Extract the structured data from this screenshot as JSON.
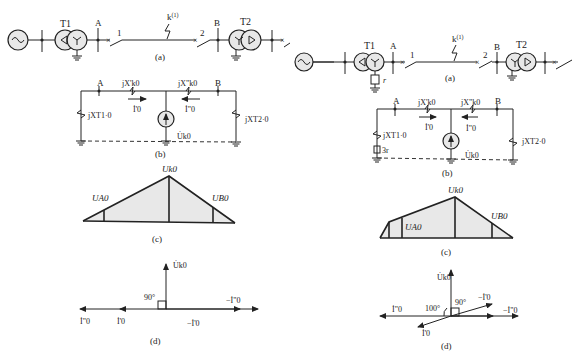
{
  "left": {
    "a": {
      "T1": "T1",
      "T2": "T2",
      "busA": "A",
      "busB": "B",
      "breaker1": "1",
      "breaker2": "2",
      "fault": "k",
      "fault_sup": "(1)",
      "caption": "(a)"
    },
    "b": {
      "busA": "A",
      "busB": "B",
      "xk0p": "jX'k0",
      "xk0pp": "jX\"k0",
      "xT1": "jXT1·0",
      "xT2": "jXT2·0",
      "i0p": "İ'0",
      "i0pp": "İ\"0",
      "uk0": "U̇k0",
      "caption": "(b)"
    },
    "c": {
      "uk0": "Uk0",
      "ua0": "UA0",
      "ub0": "UB0",
      "caption": "(c)"
    },
    "d": {
      "uk0": "U̇k0",
      "angle": "90°",
      "i0pp_left": "İ\"0",
      "i0p_left": "İ'0",
      "neg_i0p": "−İ'0",
      "neg_i0pp": "−İ\"0",
      "caption": "(d)"
    }
  },
  "right": {
    "a": {
      "T1": "T1",
      "T2": "T2",
      "busA": "A",
      "busB": "B",
      "breaker1": "1",
      "breaker2": "2",
      "fault": "k",
      "fault_sup": "(1)",
      "r": "r",
      "caption": "(a)"
    },
    "b": {
      "busA": "A",
      "busB": "B",
      "xk0p": "jX'k0",
      "xk0pp": "jX\"k0",
      "xT1": "jXT1·0",
      "xT2": "jXT2·0",
      "r3": "3r",
      "i0p": "İ'0",
      "i0pp": "İ\"0",
      "uk0": "U̇k0",
      "caption": "(b)"
    },
    "c": {
      "uk0": "Uk0",
      "ua0": "UA0",
      "ub0": "UB0",
      "caption": "(c)"
    },
    "d": {
      "uk0": "U̇k0",
      "angle90": "90°",
      "angle100": "100°",
      "i0pp_left": "İ\"0",
      "i0p_down": "İ'0",
      "neg_i0p": "−İ'0",
      "neg_i0pp": "−İ\"0",
      "caption": "(d)"
    }
  }
}
